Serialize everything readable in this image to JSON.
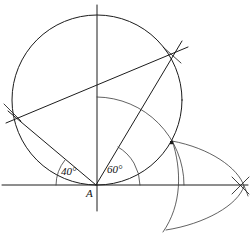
{
  "figure": {
    "background_color": "#ffffff",
    "ink_color": "#1c1c1c",
    "width": 250,
    "height": 248
  },
  "labels": {
    "angle_left": "40°",
    "angle_right": "60°",
    "vertex": "A"
  },
  "points": {
    "vertex_a": {
      "x": 96,
      "y": 185
    },
    "circle_center": {
      "x": 97,
      "y": 100
    },
    "left_intersection": {
      "x": 12,
      "y": 112
    },
    "upper_right_intersection": {
      "x": 172,
      "y": 55
    },
    "right_marked_point": {
      "x": 172,
      "y": 143
    },
    "far_right_crossing": {
      "x": 240,
      "y": 185
    },
    "lower_arc_crossing": {
      "x": 166,
      "y": 228
    }
  },
  "elements": {
    "main_circle": {
      "cx": 97,
      "cy": 100,
      "r": 85
    },
    "horizontal_axis": {
      "x1": 2,
      "y1": 185,
      "x2": 248,
      "y2": 185
    },
    "vertical_axis": {
      "x1": 97,
      "y1": 5,
      "x2": 97,
      "y2": 211
    },
    "ray_40_deg": {
      "angle": 40,
      "from": "vertex_a",
      "to": "left_intersection"
    },
    "ray_60_deg": {
      "angle": 60,
      "from": "vertex_a",
      "to": "upper_right_intersection"
    },
    "long_chord": {
      "x1": 8,
      "y1": 122,
      "x2": 186,
      "y2": 48
    },
    "arc_radius_from_a": 88,
    "small_arc_pair": "vesica lens at lower right"
  },
  "icons": {
    "vertex_marker": "point-dot-icon"
  }
}
